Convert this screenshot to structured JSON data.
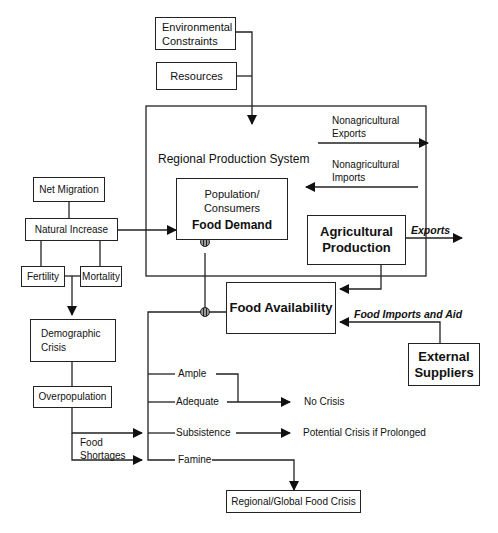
{
  "diagram": {
    "title": "Regional Production System",
    "inputs": {
      "environmental_constraints": [
        "Environmental",
        "Constraints"
      ],
      "resources": "Resources"
    },
    "population_box": {
      "line1": "Population/",
      "line2": "Consumers",
      "emphasis": "Food Demand"
    },
    "agricultural_production": [
      "Agricultural",
      "Production"
    ],
    "food_availability": "Food Availability",
    "external_suppliers": [
      "External",
      "Suppliers"
    ],
    "flows": {
      "nonag_exports": [
        "Nonagricultural",
        "Exports"
      ],
      "nonag_imports": [
        "Nonagricultural",
        "Imports"
      ],
      "exports": "Exports",
      "food_imports_aid": "Food Imports and Aid"
    },
    "demography": {
      "net_migration": "Net Migration",
      "natural_increase": "Natural Increase",
      "fertility": "Fertility",
      "mortality": "Mortality",
      "demographic_crisis": [
        "Demographic",
        "Crisis"
      ],
      "overpopulation": "Overpopulation",
      "food_shortages": [
        "Food",
        "Shortages"
      ]
    },
    "availability_levels": [
      "Ample",
      "Adequate",
      "Subsistence",
      "Famine"
    ],
    "outcomes": {
      "no_crisis": "No Crisis",
      "potential_crisis": "Potential Crisis if Prolonged",
      "regional_global": "Regional/Global Food Crisis"
    }
  }
}
